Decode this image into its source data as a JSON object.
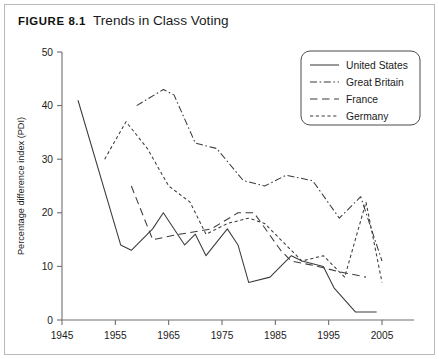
{
  "figure": {
    "label": "FIGURE 8.1",
    "title": "Trends in Class Voting"
  },
  "colors": {
    "line": "#3b3b3b",
    "axis": "#6e6e6e",
    "frame": "#b9b9b9",
    "text": "#1b1b1b",
    "background": "#ffffff"
  },
  "legend": {
    "position": "top-right",
    "entries": [
      {
        "label": "United States",
        "style": "solid"
      },
      {
        "label": "Great Britain",
        "style": "dash-dot"
      },
      {
        "label": "France",
        "style": "long-dash"
      },
      {
        "label": "Germany",
        "style": "short-dash"
      }
    ]
  },
  "chart_data": {
    "type": "line",
    "title": "Trends in Class Voting",
    "xlabel": "",
    "ylabel": "Percentage difference index (PDI)",
    "xlim": [
      1945,
      2008
    ],
    "ylim": [
      0,
      50
    ],
    "xticks": [
      1945,
      1955,
      1965,
      1975,
      1985,
      1995,
      2005
    ],
    "yticks": [
      0,
      10,
      20,
      30,
      40,
      50
    ],
    "grid": false,
    "series": [
      {
        "name": "United States",
        "style": "solid",
        "points": [
          [
            1948,
            41
          ],
          [
            1956,
            14
          ],
          [
            1958,
            13
          ],
          [
            1962,
            17
          ],
          [
            1964,
            20
          ],
          [
            1968,
            14
          ],
          [
            1970,
            16
          ],
          [
            1972,
            12
          ],
          [
            1976,
            17
          ],
          [
            1978,
            14
          ],
          [
            1980,
            7
          ],
          [
            1984,
            8
          ],
          [
            1988,
            12
          ],
          [
            1990,
            11
          ],
          [
            1994,
            10
          ],
          [
            1996,
            6
          ],
          [
            2000,
            1.5
          ],
          [
            2004,
            1.5
          ]
        ]
      },
      {
        "name": "Great Britain",
        "style": "dash-dot",
        "points": [
          [
            1959,
            40
          ],
          [
            1964,
            43
          ],
          [
            1966,
            42
          ],
          [
            1970,
            33
          ],
          [
            1974,
            32
          ],
          [
            1979,
            26
          ],
          [
            1983,
            25
          ],
          [
            1987,
            27
          ],
          [
            1992,
            26
          ],
          [
            1997,
            19
          ],
          [
            2001,
            23
          ],
          [
            2005,
            11
          ]
        ]
      },
      {
        "name": "France",
        "style": "long-dash",
        "points": [
          [
            1958,
            25
          ],
          [
            1962,
            15
          ],
          [
            1967,
            16
          ],
          [
            1973,
            17
          ],
          [
            1978,
            20
          ],
          [
            1981,
            20
          ],
          [
            1986,
            13
          ],
          [
            1988,
            11
          ],
          [
            1993,
            10
          ],
          [
            1997,
            9
          ],
          [
            2002,
            8
          ]
        ]
      },
      {
        "name": "Germany",
        "style": "short-dash",
        "points": [
          [
            1953,
            30
          ],
          [
            1957,
            37
          ],
          [
            1961,
            32
          ],
          [
            1965,
            25
          ],
          [
            1969,
            22
          ],
          [
            1972,
            16
          ],
          [
            1976,
            18
          ],
          [
            1980,
            19
          ],
          [
            1983,
            18
          ],
          [
            1987,
            14
          ],
          [
            1990,
            11
          ],
          [
            1994,
            12
          ],
          [
            1998,
            8
          ],
          [
            2002,
            22
          ],
          [
            2005,
            7
          ]
        ]
      }
    ]
  }
}
